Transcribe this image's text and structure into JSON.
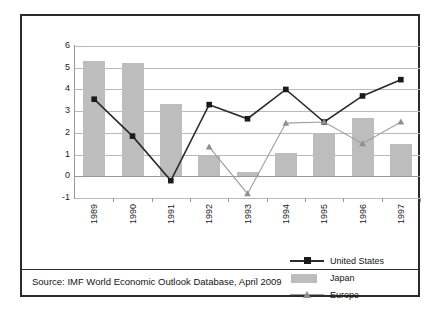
{
  "source_note": "Source: IMF World Economic Outlook Database, April 2009",
  "legend": {
    "position": "bottom-right",
    "entries": [
      {
        "label": "United States",
        "key": "line-square-dark",
        "color": "#2b2b2b"
      },
      {
        "label": "Japan",
        "key": "bar-swatch-gray",
        "color": "#bdbdbd"
      },
      {
        "label": "Europe",
        "key": "line-triangle-gray",
        "color": "#9e9e9e"
      }
    ]
  },
  "chart_data": {
    "type": "bar",
    "title": "",
    "xlabel": "",
    "ylabel": "",
    "categories": [
      "1989",
      "1990",
      "1991",
      "1992",
      "1993",
      "1994",
      "1995",
      "1996",
      "1997"
    ],
    "ylim": [
      -1,
      6
    ],
    "yticks": [
      6,
      5,
      4,
      3,
      2,
      1,
      0,
      -1
    ],
    "grid": true,
    "series": [
      {
        "name": "United States",
        "kind": "line",
        "marker": "square",
        "color": "#2b2b2b",
        "values": [
          3.55,
          1.85,
          -0.2,
          3.3,
          2.65,
          4.0,
          2.5,
          3.7,
          4.45
        ]
      },
      {
        "name": "Japan",
        "kind": "bar",
        "color": "#bdbdbd",
        "values": [
          5.3,
          5.2,
          3.35,
          0.95,
          0.2,
          1.05,
          1.95,
          2.7,
          1.5
        ]
      },
      {
        "name": "Europe",
        "kind": "line",
        "marker": "triangle",
        "color": "#9e9e9e",
        "values": [
          null,
          null,
          null,
          1.35,
          -0.8,
          2.45,
          2.5,
          1.5,
          2.5
        ]
      }
    ]
  }
}
